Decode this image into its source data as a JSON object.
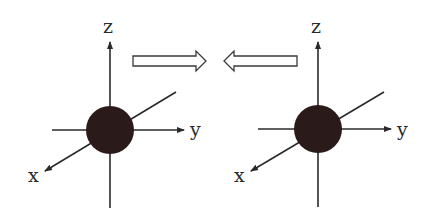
{
  "diagram": {
    "left": {
      "axes": {
        "x": "x",
        "y": "y",
        "z": "z"
      },
      "center": [
        110,
        130
      ]
    },
    "right": {
      "axes": {
        "x": "x",
        "y": "y",
        "z": "z"
      },
      "center": [
        318,
        129
      ]
    },
    "arrows": [
      {
        "direction": "right-arrow-icon"
      },
      {
        "direction": "left-arrow-icon"
      }
    ],
    "colors": {
      "line": "#2a2a2a",
      "ball": "#2b1a1a",
      "arrow_fill": "#ffffff"
    }
  }
}
